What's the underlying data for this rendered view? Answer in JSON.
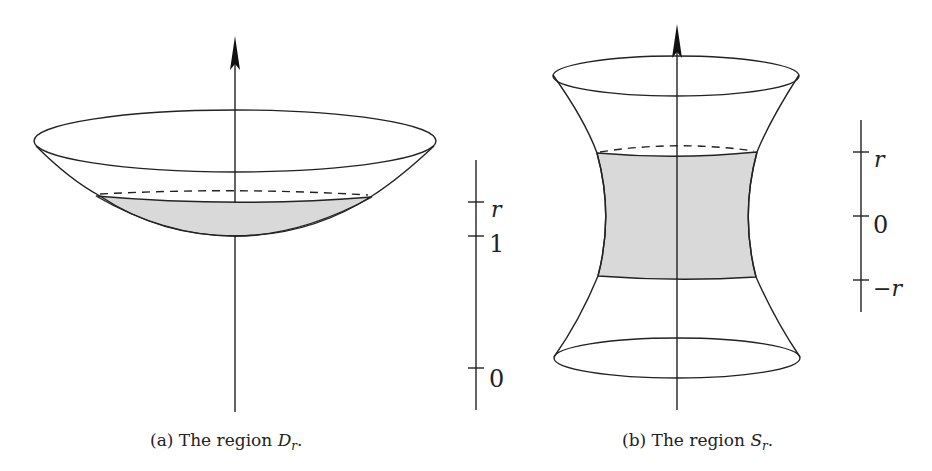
{
  "figure_a": {
    "caption_prefix": "(a) The region ",
    "caption_symbol": "D",
    "caption_subscript": "r",
    "caption_suffix": ".",
    "scale": {
      "ticks": [
        {
          "label": "r",
          "italic": true
        },
        {
          "label": "1",
          "italic": false
        },
        {
          "label": "0",
          "italic": false
        }
      ]
    }
  },
  "figure_b": {
    "caption_prefix": "(b) The region ",
    "caption_symbol": "S",
    "caption_subscript": "r",
    "caption_suffix": ".",
    "scale": {
      "ticks": [
        {
          "label": "r",
          "italic": true
        },
        {
          "label": "0",
          "italic": false
        },
        {
          "label": "−r",
          "italic": true
        }
      ]
    }
  },
  "colors": {
    "stroke": "#222222",
    "shaded_region": "#d9d9d9",
    "background": "#ffffff"
  }
}
